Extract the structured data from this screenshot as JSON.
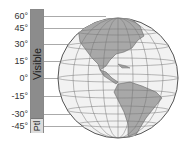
{
  "scale": {
    "labels": [
      "60°",
      "45°",
      "30°",
      "15°",
      "0°",
      "-15°",
      "-30°",
      "-45°"
    ],
    "visible_label": "Visible",
    "partial_label": "Ptl"
  },
  "globe": {
    "description": "Orthographic globe centered on the Americas with latitude/longitude grid",
    "land_color": "#a8a8a8",
    "ocean_color": "#f2f2f2"
  }
}
